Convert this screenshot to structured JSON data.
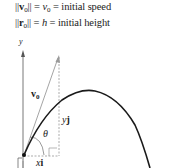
{
  "legend": {
    "line1": {
      "lhs_open": "||",
      "vec": "v",
      "sub": "0",
      "lhs_close": "||",
      "eq": " = ",
      "sym": "v",
      "sym_sub": "0",
      "rest": " = initial speed"
    },
    "line2": {
      "lhs_open": "||",
      "vec": "r",
      "sub": "0",
      "lhs_close": "||",
      "eq": " = ",
      "sym": "h",
      "rest": " = initial height"
    }
  },
  "diagram": {
    "y_axis_label": "y",
    "velocity_label": "v",
    "velocity_sub": "0",
    "angle_label": "θ",
    "vertical_component_label": "y",
    "vertical_component_unit": "j",
    "horizontal_component_label": "x",
    "horizontal_component_unit": "i",
    "colors": {
      "curve": "#1a1a1a",
      "vector": "#9a9a9a",
      "axis": "#555555",
      "dashed": "#888888"
    }
  }
}
